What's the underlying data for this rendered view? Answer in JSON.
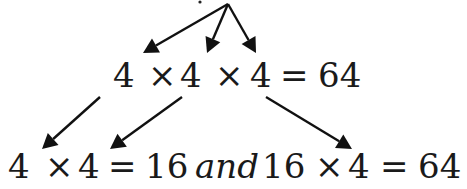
{
  "diagram": {
    "type": "expansion-tree",
    "apex": {
      "x": 228,
      "y": 4
    },
    "colors": {
      "text": "#1a1a1a",
      "arrow": "#111111",
      "background": "#ffffff"
    },
    "row1": {
      "tokens": [
        {
          "text": "4",
          "x": 113
        },
        {
          "text": "×",
          "x": 148
        },
        {
          "text": "4",
          "x": 180
        },
        {
          "text": "×",
          "x": 215
        },
        {
          "text": "4",
          "x": 250
        },
        {
          "text": "=",
          "x": 280
        },
        {
          "text": "64",
          "x": 318
        }
      ],
      "full_text": "4 × 4 × 4 = 64"
    },
    "row2": {
      "tokens": [
        {
          "text": "4",
          "x": 8,
          "italic": false
        },
        {
          "text": "×",
          "x": 45,
          "italic": false
        },
        {
          "text": "4",
          "x": 78,
          "italic": false
        },
        {
          "text": "=",
          "x": 108,
          "italic": false
        },
        {
          "text": "16",
          "x": 145,
          "italic": false
        },
        {
          "text": "and",
          "x": 195,
          "italic": true
        },
        {
          "text": "16",
          "x": 262,
          "italic": false
        },
        {
          "text": "×",
          "x": 315,
          "italic": false
        },
        {
          "text": "4",
          "x": 348,
          "italic": false
        },
        {
          "text": "=",
          "x": 380,
          "italic": false
        },
        {
          "text": "64",
          "x": 418,
          "italic": false
        }
      ],
      "full_text": "4 × 4 = 16 and 16 × 4 = 64"
    },
    "arrows_top": [
      {
        "from": [
          228,
          4
        ],
        "to": [
          143,
          53
        ]
      },
      {
        "from": [
          228,
          4
        ],
        "to": [
          207,
          53
        ]
      },
      {
        "from": [
          228,
          4
        ],
        "to": [
          256,
          53
        ]
      }
    ],
    "arrows_bottom": [
      {
        "from": [
          100,
          97
        ],
        "to": [
          42,
          149
        ]
      },
      {
        "from": [
          182,
          97
        ],
        "to": [
          110,
          149
        ]
      },
      {
        "from": [
          266,
          97
        ],
        "to": [
          352,
          149
        ]
      }
    ]
  }
}
